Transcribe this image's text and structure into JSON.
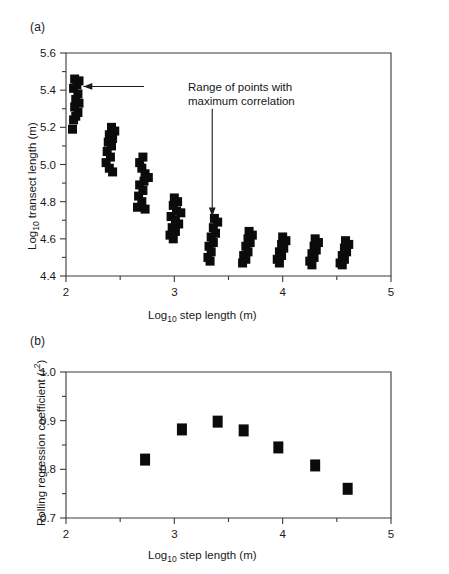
{
  "figure": {
    "panels": [
      {
        "key": "a",
        "label": "(a)",
        "xlabel_main": "Log",
        "xlabel_sub": "10",
        "xlabel_rest": " step length (m)",
        "ylabel_main": "Log",
        "ylabel_sub": "10",
        "ylabel_rest": " transect length (m)",
        "annotation_line1": "Range of points with",
        "annotation_line2": "maximum correlation"
      },
      {
        "key": "b",
        "label": "(b)",
        "xlabel_main": "Log",
        "xlabel_sub": "10",
        "xlabel_rest": " step length (m)",
        "ylabel_main": "Rolling regression coefficient (",
        "ylabel_ital": "r",
        "ylabel_sup": "2",
        "ylabel_rest": ")"
      }
    ],
    "colors": {
      "marker": "#0b0b0b",
      "axis": "#3a3a3a",
      "text": "#1a1a1a",
      "background": "#ffffff"
    }
  },
  "chart_data": [
    {
      "type": "scatter",
      "panel": "a",
      "title": "",
      "xlabel": "Log10 step length (m)",
      "ylabel": "Log10 transect length (m)",
      "xlim": [
        2,
        5
      ],
      "ylim": [
        4.4,
        5.6
      ],
      "xticks": [
        2,
        3,
        4,
        5
      ],
      "xticklabels": [
        "2",
        "3",
        "4",
        "5"
      ],
      "xminorticks": [
        2.5,
        3.5,
        4.5
      ],
      "yticks": [
        4.4,
        4.6,
        4.8,
        5.0,
        5.2,
        5.4,
        5.6
      ],
      "yticklabels": [
        "4.4",
        "4.6",
        "4.8",
        "5.0",
        "5.2",
        "5.4",
        "5.6"
      ],
      "yminorticks": [
        4.5,
        4.7,
        4.9,
        5.1,
        5.3,
        5.5
      ],
      "grid": false,
      "legend": "none",
      "annotations": [
        {
          "text": "Range of points with maximum correlation",
          "arrows": [
            {
              "from_x": 2.72,
              "from_y": 5.42,
              "to_x": 2.16,
              "to_y": 5.42,
              "style": "horizontal-left"
            },
            {
              "from_x": 3.35,
              "from_y": 5.3,
              "to_x": 3.35,
              "to_y": 4.72,
              "style": "vertical-down"
            }
          ]
        }
      ],
      "clusters": [
        {
          "x_center": 2.1,
          "label": "cluster-1",
          "points": [
            {
              "x": 2.08,
              "y": 5.46
            },
            {
              "x": 2.12,
              "y": 5.45
            },
            {
              "x": 2.1,
              "y": 5.43
            },
            {
              "x": 2.07,
              "y": 5.41
            },
            {
              "x": 2.11,
              "y": 5.38
            },
            {
              "x": 2.09,
              "y": 5.35
            },
            {
              "x": 2.12,
              "y": 5.33
            },
            {
              "x": 2.08,
              "y": 5.31
            },
            {
              "x": 2.11,
              "y": 5.28
            },
            {
              "x": 2.09,
              "y": 5.26
            },
            {
              "x": 2.07,
              "y": 5.24
            },
            {
              "x": 2.06,
              "y": 5.19
            }
          ]
        },
        {
          "x_center": 2.4,
          "label": "cluster-2",
          "points": [
            {
              "x": 2.42,
              "y": 5.2
            },
            {
              "x": 2.45,
              "y": 5.18
            },
            {
              "x": 2.4,
              "y": 5.16
            },
            {
              "x": 2.43,
              "y": 5.14
            },
            {
              "x": 2.39,
              "y": 5.12
            },
            {
              "x": 2.42,
              "y": 5.1
            },
            {
              "x": 2.38,
              "y": 5.07
            },
            {
              "x": 2.41,
              "y": 5.04
            },
            {
              "x": 2.37,
              "y": 5.01
            },
            {
              "x": 2.4,
              "y": 4.98
            },
            {
              "x": 2.43,
              "y": 4.96
            }
          ]
        },
        {
          "x_center": 2.7,
          "label": "cluster-3",
          "points": [
            {
              "x": 2.71,
              "y": 5.04
            },
            {
              "x": 2.68,
              "y": 5.01
            },
            {
              "x": 2.7,
              "y": 4.98
            },
            {
              "x": 2.73,
              "y": 4.95
            },
            {
              "x": 2.76,
              "y": 4.93
            },
            {
              "x": 2.72,
              "y": 4.91
            },
            {
              "x": 2.68,
              "y": 4.89
            },
            {
              "x": 2.71,
              "y": 4.86
            },
            {
              "x": 2.67,
              "y": 4.83
            },
            {
              "x": 2.7,
              "y": 4.8
            },
            {
              "x": 2.66,
              "y": 4.77
            },
            {
              "x": 2.73,
              "y": 4.76
            }
          ]
        },
        {
          "x_center": 3.0,
          "label": "cluster-4",
          "points": [
            {
              "x": 3.0,
              "y": 4.82
            },
            {
              "x": 3.03,
              "y": 4.8
            },
            {
              "x": 2.99,
              "y": 4.78
            },
            {
              "x": 3.02,
              "y": 4.75
            },
            {
              "x": 3.06,
              "y": 4.74
            },
            {
              "x": 2.97,
              "y": 4.72
            },
            {
              "x": 3.01,
              "y": 4.7
            },
            {
              "x": 3.04,
              "y": 4.68
            },
            {
              "x": 2.98,
              "y": 4.66
            },
            {
              "x": 3.01,
              "y": 4.64
            },
            {
              "x": 2.96,
              "y": 4.62
            },
            {
              "x": 2.99,
              "y": 4.6
            }
          ]
        },
        {
          "x_center": 3.35,
          "label": "cluster-5",
          "points": [
            {
              "x": 3.37,
              "y": 4.71
            },
            {
              "x": 3.4,
              "y": 4.69
            },
            {
              "x": 3.36,
              "y": 4.66
            },
            {
              "x": 3.38,
              "y": 4.63
            },
            {
              "x": 3.34,
              "y": 4.61
            },
            {
              "x": 3.36,
              "y": 4.58
            },
            {
              "x": 3.32,
              "y": 4.56
            },
            {
              "x": 3.34,
              "y": 4.53
            },
            {
              "x": 3.31,
              "y": 4.5
            },
            {
              "x": 3.33,
              "y": 4.48
            }
          ]
        },
        {
          "x_center": 3.65,
          "label": "cluster-6",
          "points": [
            {
              "x": 3.69,
              "y": 4.64
            },
            {
              "x": 3.72,
              "y": 4.62
            },
            {
              "x": 3.68,
              "y": 4.6
            },
            {
              "x": 3.7,
              "y": 4.58
            },
            {
              "x": 3.66,
              "y": 4.56
            },
            {
              "x": 3.68,
              "y": 4.53
            },
            {
              "x": 3.64,
              "y": 4.51
            },
            {
              "x": 3.66,
              "y": 4.49
            },
            {
              "x": 3.63,
              "y": 4.47
            }
          ]
        },
        {
          "x_center": 3.95,
          "label": "cluster-7",
          "points": [
            {
              "x": 4.0,
              "y": 4.61
            },
            {
              "x": 4.03,
              "y": 4.59
            },
            {
              "x": 3.99,
              "y": 4.57
            },
            {
              "x": 4.01,
              "y": 4.55
            },
            {
              "x": 3.97,
              "y": 4.53
            },
            {
              "x": 3.99,
              "y": 4.51
            },
            {
              "x": 3.95,
              "y": 4.49
            },
            {
              "x": 3.97,
              "y": 4.47
            }
          ]
        },
        {
          "x_center": 4.25,
          "label": "cluster-8",
          "points": [
            {
              "x": 4.3,
              "y": 4.6
            },
            {
              "x": 4.33,
              "y": 4.58
            },
            {
              "x": 4.29,
              "y": 4.56
            },
            {
              "x": 4.31,
              "y": 4.54
            },
            {
              "x": 4.27,
              "y": 4.52
            },
            {
              "x": 4.29,
              "y": 4.5
            },
            {
              "x": 4.25,
              "y": 4.48
            },
            {
              "x": 4.27,
              "y": 4.46
            }
          ]
        },
        {
          "x_center": 4.55,
          "label": "cluster-9",
          "points": [
            {
              "x": 4.58,
              "y": 4.59
            },
            {
              "x": 4.61,
              "y": 4.57
            },
            {
              "x": 4.57,
              "y": 4.55
            },
            {
              "x": 4.59,
              "y": 4.53
            },
            {
              "x": 4.55,
              "y": 4.51
            },
            {
              "x": 4.57,
              "y": 4.49
            },
            {
              "x": 4.53,
              "y": 4.47
            },
            {
              "x": 4.55,
              "y": 4.46
            }
          ]
        }
      ]
    },
    {
      "type": "scatter",
      "panel": "b",
      "title": "",
      "xlabel": "Log10 step length (m)",
      "ylabel": "Rolling regression coefficient (r2)",
      "xlim": [
        2,
        5
      ],
      "ylim": [
        0.7,
        1.0
      ],
      "xticks": [
        2,
        3,
        4,
        5
      ],
      "xticklabels": [
        "2",
        "3",
        "4",
        "5"
      ],
      "xminorticks": [
        2.5,
        3.5,
        4.5
      ],
      "yticks": [
        0.7,
        0.8,
        0.9,
        1.0
      ],
      "yticklabels": [
        "0.7",
        "0.8",
        "0.9",
        "1.0"
      ],
      "yminorticks": [
        0.75,
        0.85,
        0.95
      ],
      "grid": false,
      "legend": "none",
      "x": [
        2.73,
        3.07,
        3.4,
        3.64,
        3.96,
        4.3,
        4.6
      ],
      "values": [
        0.82,
        0.882,
        0.898,
        0.88,
        0.845,
        0.808,
        0.76
      ]
    }
  ]
}
